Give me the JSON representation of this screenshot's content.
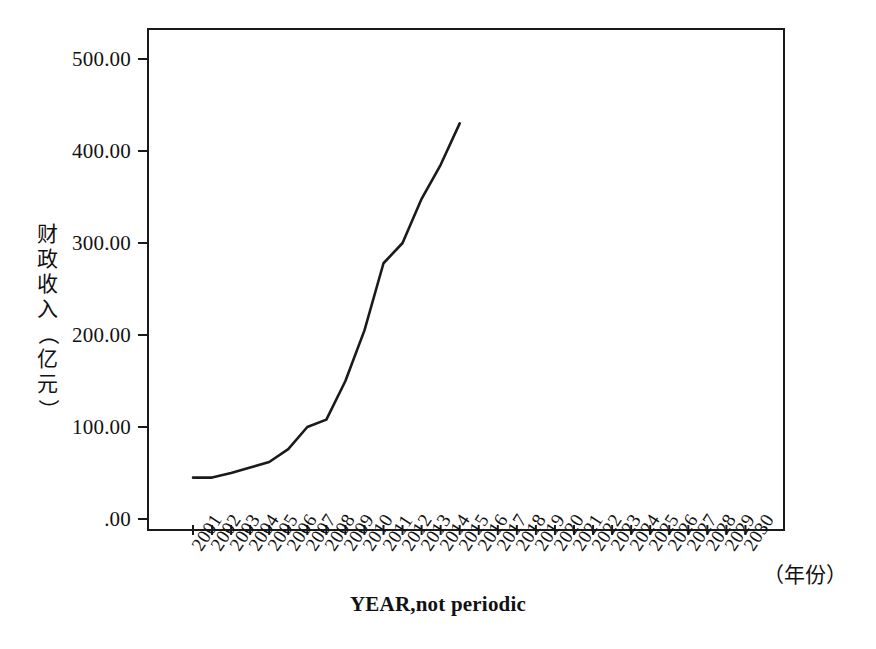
{
  "chart_data": {
    "type": "line",
    "title": "",
    "subtitle": "",
    "xlabel": "YEAR,not periodic",
    "ylabel": "财政收入（亿元）",
    "x_unit_note": "（年份）",
    "grid": false,
    "legend": "none",
    "xlim": [
      2001,
      2030
    ],
    "ylim": [
      0,
      530
    ],
    "y_ticks": [
      {
        "value": 500,
        "label": "500.00"
      },
      {
        "value": 400,
        "label": "400.00"
      },
      {
        "value": 300,
        "label": "300.00"
      },
      {
        "value": 200,
        "label": "200.00"
      },
      {
        "value": 100,
        "label": "100.00"
      },
      {
        "value": 0,
        "label": ".00"
      }
    ],
    "categories": [
      "2001",
      "2002",
      "2003",
      "2004",
      "2005",
      "2006",
      "2007",
      "2008",
      "2009",
      "2010",
      "2011",
      "2012",
      "2013",
      "2014",
      "2015",
      "2016",
      "2017",
      "2018",
      "2019",
      "2020",
      "2021",
      "2022",
      "2023",
      "2024",
      "2025",
      "2026",
      "2027",
      "2028",
      "2029",
      "2030"
    ],
    "series": [
      {
        "name": "财政收入",
        "color": "#1a1a1a",
        "x": [
          2001,
          2002,
          2003,
          2004,
          2005,
          2006,
          2007,
          2008,
          2009,
          2010,
          2011,
          2012,
          2013,
          2014,
          2015
        ],
        "values": [
          45,
          45,
          50,
          56,
          62,
          76,
          100,
          108,
          150,
          205,
          278,
          300,
          348,
          385,
          430
        ]
      }
    ]
  },
  "axis_label_chars": {
    "y_title_parts": [
      "财",
      "政",
      "收",
      "入",
      "（",
      "亿",
      "元",
      "）"
    ]
  }
}
